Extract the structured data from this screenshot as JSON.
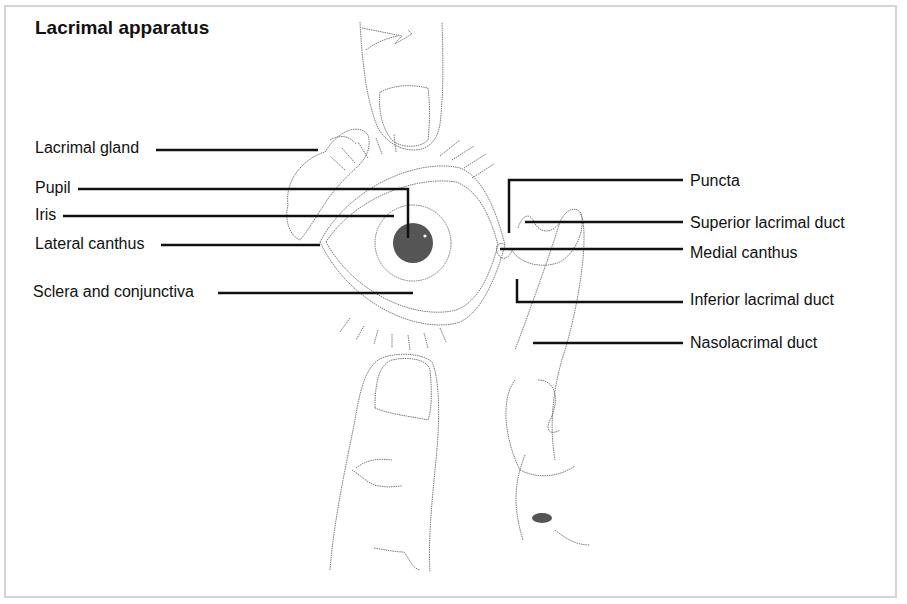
{
  "figure": {
    "title": "Lacrimal apparatus",
    "labels_left": [
      {
        "id": "lacrimal-gland",
        "text": "Lacrimal gland"
      },
      {
        "id": "pupil",
        "text": "Pupil"
      },
      {
        "id": "iris",
        "text": "Iris"
      },
      {
        "id": "lateral-canthus",
        "text": "Lateral canthus"
      },
      {
        "id": "sclera-conjunctiva",
        "text": "Sclera and conjunctiva"
      }
    ],
    "labels_right": [
      {
        "id": "puncta",
        "text": "Puncta"
      },
      {
        "id": "superior-lacrimal-duct",
        "text": "Superior lacrimal duct"
      },
      {
        "id": "medial-canthus",
        "text": "Medial canthus"
      },
      {
        "id": "inferior-lacrimal-duct",
        "text": "Inferior lacrimal duct"
      },
      {
        "id": "nasolacrimal-duct",
        "text": "Nasolacrimal duct"
      }
    ],
    "colors": {
      "line": "#111111",
      "sketch": "#7a7a7a",
      "pupil": "#555555",
      "border": "#d4d4d4"
    }
  }
}
